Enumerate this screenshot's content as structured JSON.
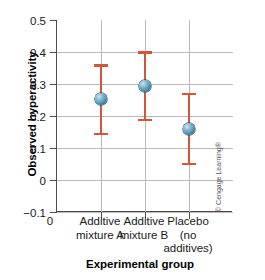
{
  "chart_data": {
    "type": "scatter",
    "title": "",
    "xlabel": "Experimental group",
    "ylabel": "Observed hyperactivity",
    "categories": [
      "Additive mixture A",
      "Additive mixture B",
      "Placebo (no additives)"
    ],
    "category_lines": [
      [
        "Additive",
        "mixture A"
      ],
      [
        "Additive",
        "mixture B"
      ],
      [
        "Placebo",
        "(no",
        "additives)"
      ]
    ],
    "values": [
      0.253,
      0.295,
      0.158
    ],
    "error_low": [
      0.145,
      0.188,
      0.051
    ],
    "error_high": [
      0.358,
      0.4,
      0.27
    ],
    "ylim": [
      -0.1,
      0.5
    ],
    "yticks": [
      0.5,
      0.4,
      0.3,
      0.2,
      0.1,
      0,
      -0.1
    ],
    "ytick_labels": [
      "0.5",
      "0.4",
      "0.3",
      "0.2",
      "0.1",
      "0",
      "−0.1"
    ],
    "origin_label": "0",
    "grid": true,
    "legend": "none",
    "marker_color": "#4b8fae",
    "error_color": "#d1563a",
    "grid_color": "#b9b9b9",
    "axis_color": "#4d4d4d"
  },
  "credit": {
    "text": "© Cengage Learning®"
  }
}
